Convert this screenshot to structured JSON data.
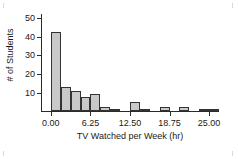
{
  "chart_data": {
    "type": "bar",
    "title": "",
    "xlabel": "TV Watched per Week (hr)",
    "ylabel": "# of Students",
    "xlim": [
      -1.5625,
      26.5625
    ],
    "ylim": [
      0,
      52
    ],
    "grid": false,
    "legend": "none",
    "bin_width": 1.5625,
    "yticks": [
      10,
      20,
      30,
      40,
      50
    ],
    "ytick_labels": [
      "10",
      "20",
      "30",
      "40",
      "50"
    ],
    "xticks": [
      0.0,
      6.25,
      12.5,
      18.75,
      25.0
    ],
    "xtick_labels": [
      "0.00",
      "6.25",
      "12.50",
      "18.75",
      "25.00"
    ],
    "categories": [
      "0.00",
      "1.56",
      "3.13",
      "4.69",
      "6.25",
      "7.81",
      "9.38",
      "10.94",
      "12.50",
      "14.06",
      "15.63",
      "17.19",
      "18.75",
      "20.31",
      "21.88",
      "23.44",
      "25.00"
    ],
    "bin_starts": [
      0.0,
      1.5625,
      3.125,
      4.6875,
      6.25,
      7.8125,
      9.375,
      10.9375,
      12.5,
      14.0625,
      15.625,
      17.1875,
      18.75,
      20.3125,
      21.875,
      23.4375,
      25.0
    ],
    "values": [
      42,
      13,
      10.5,
      7.5,
      9,
      2,
      1,
      0,
      5,
      1,
      0,
      2,
      0,
      2,
      0,
      0.8,
      1
    ],
    "colors": {
      "bar_fill": "#c9c9c9",
      "bar_edge": "#333333",
      "axis": "#2b2b2b",
      "text": "#1a1a1a",
      "background": "#ffffff"
    }
  }
}
